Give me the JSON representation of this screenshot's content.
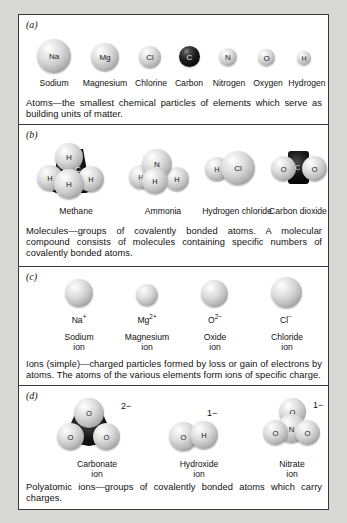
{
  "figure": {
    "panels": [
      {
        "letter": "(a)",
        "items": [
          {
            "symbol": "Na",
            "name": "Sodium"
          },
          {
            "symbol": "Mg",
            "name": "Magnesium"
          },
          {
            "symbol": "Cl",
            "name": "Chlorine"
          },
          {
            "symbol": "C",
            "name": "Carbon"
          },
          {
            "symbol": "N",
            "name": "Nitrogen"
          },
          {
            "symbol": "O",
            "name": "Oxygen"
          },
          {
            "symbol": "H",
            "name": "Hydrogen"
          }
        ],
        "caption": "Atoms—the smallest chemical particles of elements which serve as building units of matter."
      },
      {
        "letter": "(b)",
        "items": [
          {
            "name": "Methane",
            "atoms": [
              "H",
              "H",
              "H",
              "H",
              "C"
            ]
          },
          {
            "name": "Ammonia",
            "atoms": [
              "N",
              "H",
              "H",
              "H"
            ]
          },
          {
            "name": "Hydrogen chloride",
            "atoms": [
              "H",
              "Cl"
            ]
          },
          {
            "name": "Carbon dioxide",
            "atoms": [
              "O",
              "C",
              "O"
            ]
          }
        ],
        "caption": "Molecules—groups of covalently bonded atoms. A molecular compound consists of molecules containing specific numbers of covalently bonded atoms."
      },
      {
        "letter": "(c)",
        "items": [
          {
            "formula": "Na",
            "charge": "+",
            "name1": "Sodium",
            "name2": "ion"
          },
          {
            "formula": "Mg",
            "charge": "2+",
            "name1": "Magnesium",
            "name2": "ion"
          },
          {
            "formula": "O",
            "charge": "2−",
            "name1": "Oxide",
            "name2": "ion"
          },
          {
            "formula": "Cl",
            "charge": "−",
            "name1": "Chloride",
            "name2": "ion"
          }
        ],
        "caption": "Ions (simple)—charged particles formed by loss or gain of electrons by atoms. The atoms of the various elements form ions of specific charge."
      },
      {
        "letter": "(d)",
        "items": [
          {
            "name1": "Carbonate",
            "name2": "ion",
            "charge": "2−",
            "atoms": [
              "O",
              "O",
              "O",
              "C"
            ]
          },
          {
            "name1": "Hydroxide",
            "name2": "ion",
            "charge": "1−",
            "atoms": [
              "O",
              "H"
            ]
          },
          {
            "name1": "Nitrate",
            "name2": "ion",
            "charge": "1−",
            "atoms": [
              "O",
              "N",
              "O",
              "O"
            ]
          }
        ],
        "caption": "Polyatomic ions—groups of covalently bonded atoms which carry charges."
      }
    ]
  }
}
